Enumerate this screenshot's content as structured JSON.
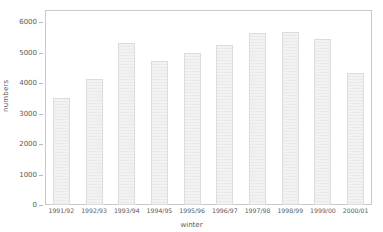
{
  "chart_data": {
    "type": "bar",
    "title": "",
    "subtitle": "",
    "xlabel": "winter",
    "ylabel": "numbers",
    "categories": [
      "1991/92",
      "1992/93",
      "1993/94",
      "1994/95",
      "1995/96",
      "1996/97",
      "1997/98",
      "1998/99",
      "1999/00",
      "2000/01"
    ],
    "values": [
      3500,
      4150,
      5330,
      4730,
      4990,
      5250,
      5630,
      5670,
      5450,
      4320
    ],
    "series": [
      {
        "name": "numbers",
        "values": [
          3500,
          4150,
          5330,
          4730,
          4990,
          5250,
          5630,
          5670,
          5450,
          4320
        ]
      }
    ],
    "ylim": [
      0,
      6400
    ],
    "xlim": [
      0,
      10
    ],
    "y_ticks": [
      0,
      1000,
      2000,
      3000,
      4000,
      5000,
      6000
    ],
    "y_tick_labels": [
      "0",
      "1000",
      "2000",
      "3000",
      "4000",
      "5000",
      "6000"
    ],
    "grid": false,
    "legend": null,
    "legend_position": "none",
    "bar_fill_color": "#f2f2f2",
    "bar_edge_color": "#dcdcde",
    "axis_color": "#c9c9cb",
    "text_color": "#59595b",
    "background_color": "#ffffff",
    "annotations": []
  }
}
